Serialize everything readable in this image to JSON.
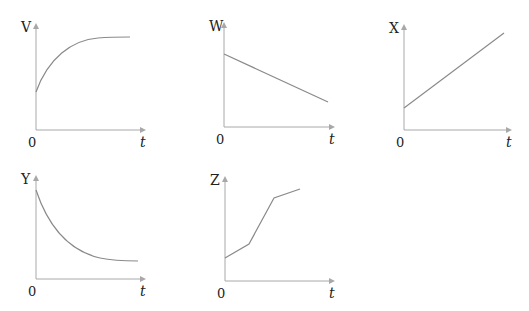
{
  "colors": {
    "axis": "#a8a8a8",
    "curve": "#8a8a8a",
    "text": "#222222",
    "background": "#ffffff"
  },
  "graphs": [
    {
      "id": "V",
      "y_label": "V",
      "x_label": "t",
      "origin_label": "0",
      "shape": "rising curve approaching constant (exponential saturation)",
      "origin": [
        36,
        130
      ],
      "y_top": 23,
      "x_end": 146,
      "path": "M36,92 C48,58 72,40 98,38 C110,37 120,37 130,37"
    },
    {
      "id": "W",
      "y_label": "W",
      "x_label": "t",
      "origin_label": "0",
      "shape": "straight line decreasing from positive intercept",
      "origin": [
        224,
        127
      ],
      "y_top": 22,
      "x_end": 335,
      "path": "M224,54 L328,102"
    },
    {
      "id": "X",
      "y_label": "X",
      "x_label": "t",
      "origin_label": "0",
      "shape": "straight line increasing from positive intercept",
      "origin": [
        404,
        130
      ],
      "y_top": 24,
      "x_end": 512,
      "path": "M404,108 L504,33"
    },
    {
      "id": "Y",
      "y_label": "Y",
      "x_label": "t",
      "origin_label": "0",
      "shape": "decreasing curve approaching constant (exponential decay)",
      "origin": [
        36,
        279
      ],
      "y_top": 175,
      "x_end": 146,
      "path": "M36,190 C50,232 74,252 100,258 C114,261 126,261 138,261"
    },
    {
      "id": "Z",
      "y_label": "Z",
      "x_label": "t",
      "origin_label": "0",
      "shape": "piecewise linear increasing: gentle, steep, gentle",
      "origin": [
        225,
        281
      ],
      "y_top": 176,
      "x_end": 335,
      "path": "M225,258 L249,244 L274,198 L300,189"
    }
  ],
  "chart_data": [
    {
      "type": "line",
      "title": "V vs t",
      "xlabel": "t",
      "ylabel": "V",
      "x_origin_label": "0",
      "series": [
        {
          "name": "V",
          "x": [
            0,
            0.1,
            0.25,
            0.5,
            0.75,
            1.0
          ],
          "values": [
            0.35,
            0.6,
            0.8,
            0.93,
            0.98,
            1.0
          ]
        }
      ],
      "grid": false
    },
    {
      "type": "line",
      "title": "W vs t",
      "xlabel": "t",
      "ylabel": "W",
      "x_origin_label": "0",
      "series": [
        {
          "name": "W",
          "x": [
            0,
            1
          ],
          "values": [
            0.7,
            0.25
          ]
        }
      ],
      "grid": false
    },
    {
      "type": "line",
      "title": "X vs t",
      "xlabel": "t",
      "ylabel": "X",
      "x_origin_label": "0",
      "series": [
        {
          "name": "X",
          "x": [
            0,
            1
          ],
          "values": [
            0.2,
            0.9
          ]
        }
      ],
      "grid": false
    },
    {
      "type": "line",
      "title": "Y vs t",
      "xlabel": "t",
      "ylabel": "Y",
      "x_origin_label": "0",
      "series": [
        {
          "name": "Y",
          "x": [
            0,
            0.1,
            0.25,
            0.5,
            0.75,
            1.0
          ],
          "values": [
            0.85,
            0.6,
            0.4,
            0.25,
            0.2,
            0.18
          ]
        }
      ],
      "grid": false
    },
    {
      "type": "line",
      "title": "Z vs t",
      "xlabel": "t",
      "ylabel": "Z",
      "x_origin_label": "0",
      "series": [
        {
          "name": "Z",
          "x": [
            0,
            0.22,
            0.45,
            0.68
          ],
          "values": [
            0.22,
            0.35,
            0.79,
            0.88
          ]
        }
      ],
      "grid": false
    }
  ]
}
